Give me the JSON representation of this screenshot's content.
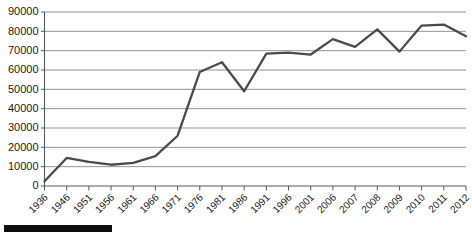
{
  "chart_data": {
    "type": "line",
    "title": "",
    "subtitle": "",
    "xlabel": "",
    "ylabel": "",
    "categories": [
      "1936",
      "1946",
      "1951",
      "1956",
      "1961",
      "1966",
      "1971",
      "1976",
      "1981",
      "1986",
      "1991",
      "1996",
      "2001",
      "2006",
      "2007",
      "2008",
      "2009",
      "2010",
      "2011",
      "2012"
    ],
    "values": [
      2500,
      14500,
      12500,
      11000,
      12000,
      15500,
      26000,
      59000,
      64000,
      49000,
      68500,
      69000,
      68000,
      76000,
      72000,
      81000,
      69500,
      83000,
      83500,
      77500
    ],
    "series": [
      {
        "name": "series-1",
        "values": [
          2500,
          14500,
          12500,
          11000,
          12000,
          15500,
          26000,
          59000,
          64000,
          49000,
          68500,
          69000,
          68000,
          76000,
          72000,
          81000,
          69500,
          83000,
          83500,
          77500
        ]
      }
    ],
    "ylim": [
      0,
      90000
    ],
    "y_ticks": [
      0,
      10000,
      20000,
      30000,
      40000,
      50000,
      60000,
      70000,
      80000,
      90000
    ],
    "y_tick_labels": [
      "0",
      "10000",
      "20000",
      "30000",
      "40000",
      "50000",
      "60000",
      "70000",
      "80000",
      "90000"
    ],
    "grid": true,
    "grid_axis": "y",
    "legend": false,
    "legend_position": "none",
    "line_color": "#4a4a4a",
    "grid_color": "#878787",
    "axis_color": "#5a5a5a",
    "background_color": "#ffffff",
    "annotations": []
  },
  "decorations": {
    "bottom_bar_color": "#0d0d0d",
    "bottom_bar_name": "scale-bar"
  }
}
